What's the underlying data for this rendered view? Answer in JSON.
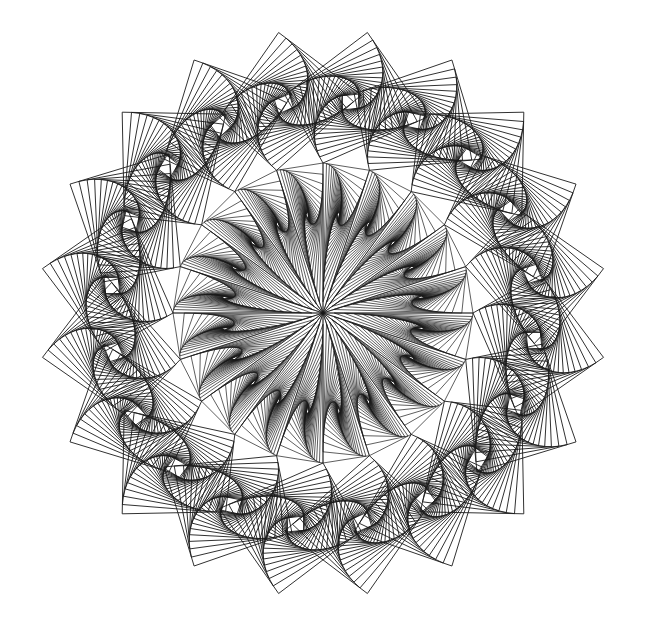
{
  "artwork": {
    "title": "Geometric pursuit-curve mandala",
    "background": "#ffffff",
    "stroke_color": "#1a1a1a",
    "center": [
      323,
      313
    ],
    "outer_radius": 284,
    "inner_radius": 150,
    "sectors": 20,
    "pursuit_steps": 22,
    "pursuit_ratio": 0.09,
    "inner_steps": 26,
    "inner_ratio": 0.075
  }
}
